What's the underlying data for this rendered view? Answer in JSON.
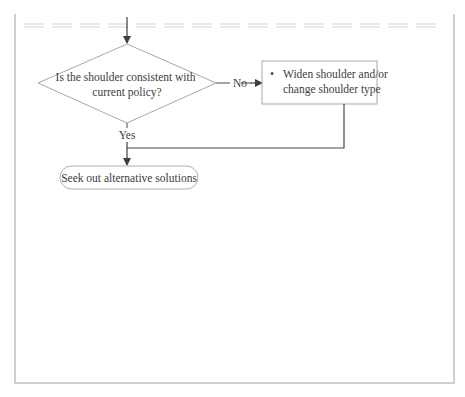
{
  "diagram": {
    "decision": {
      "text_lines": [
        "Is the shoulder consistent with",
        "current policy?"
      ]
    },
    "edge_no": {
      "label": "No"
    },
    "edge_yes": {
      "label": "Yes"
    },
    "action_box": {
      "bullet": "•",
      "text_lines": [
        "Widen shoulder and/or",
        "change shoulder type"
      ]
    },
    "terminal": {
      "text": "Seek out alternative solutions"
    }
  },
  "colors": {
    "line": "#4a4a4a",
    "shape_border": "#a8a8a8",
    "frame": "#cfcfcf",
    "dashed_rule": "#d4d4d4"
  }
}
